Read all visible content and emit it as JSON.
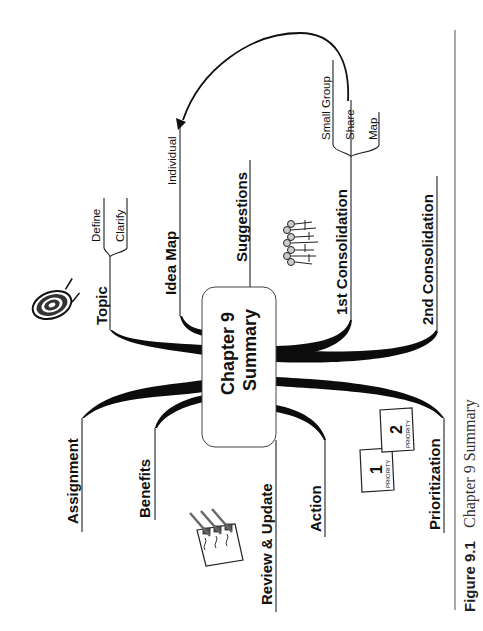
{
  "figure": {
    "caption_label": "Figure 9.1",
    "caption_title": "Chapter 9 Summary"
  },
  "center": {
    "line1": "Chapter 9",
    "line2": "Summary"
  },
  "branches": {
    "topic": {
      "label": "Topic",
      "children": [
        "Define",
        "Clarify"
      ],
      "icon": "target-icon"
    },
    "idea_map": {
      "label": "Idea Map",
      "children": [
        "Individual"
      ]
    },
    "suggestions": {
      "label": "Suggestions"
    },
    "first_consolidation": {
      "label": "1st Consolidation",
      "children": [
        "Small Group",
        "Share",
        "Map"
      ],
      "icon": "people-group-icon"
    },
    "second_consolidation": {
      "label": "2nd Consolidation"
    },
    "assignment": {
      "label": "Assignment"
    },
    "benefits": {
      "label": "Benefits"
    },
    "review_update": {
      "label": "Review & Update",
      "icon": "checklist-icon"
    },
    "action": {
      "label": "Action"
    },
    "prioritization": {
      "label": "Prioritization",
      "icon": "priority-notes-icon"
    }
  },
  "connector": {
    "from": "Share",
    "to": "Individual",
    "style": "curved-arrow"
  },
  "icons": {
    "priority_1": "1",
    "priority_2": "2",
    "priority_word": "PRIORITY"
  },
  "colors": {
    "ink": "#111111",
    "background": "#ffffff",
    "rule": "#555555"
  }
}
